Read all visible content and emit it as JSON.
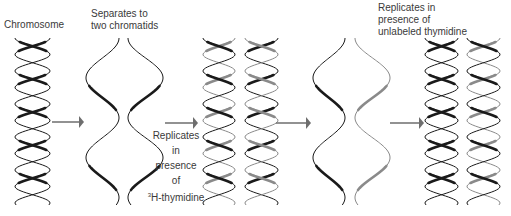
{
  "labels": {
    "chromosome": "Chromosome",
    "separates": [
      "Separates to",
      "two chromatids"
    ],
    "replicates_labeled": [
      "Replicates",
      "in",
      "presence",
      "of"
    ],
    "labeled_sup": "3",
    "labeled_thymidine": "H-thymidine",
    "replicates_unlabeled": [
      "Replicates in",
      "presence of",
      "unlabeled thymidine"
    ]
  },
  "colors": {
    "old_strand": "#1a1a1a",
    "labeled_strand": "#8a8a8a",
    "arrow": "#6e6e6e",
    "text": "#3a3a3a"
  },
  "stages": [
    {
      "name": "chromosome",
      "helices": [
        {
          "type": "double",
          "strands": [
            "old",
            "old"
          ]
        }
      ]
    },
    {
      "name": "separated-chromatids",
      "helices": [
        {
          "type": "single",
          "strands": [
            "old"
          ]
        },
        {
          "type": "single",
          "strands": [
            "old"
          ]
        }
      ]
    },
    {
      "name": "replicated-labeled",
      "helices": [
        {
          "type": "double",
          "strands": [
            "old",
            "labeled"
          ]
        },
        {
          "type": "double",
          "strands": [
            "labeled",
            "old"
          ]
        }
      ]
    },
    {
      "name": "separated-after-label",
      "helices": [
        {
          "type": "single",
          "strands": [
            "old"
          ]
        },
        {
          "type": "single",
          "strands": [
            "labeled"
          ]
        }
      ]
    },
    {
      "name": "replicated-unlabeled",
      "helices": [
        {
          "type": "double",
          "strands": [
            "old",
            "old"
          ]
        },
        {
          "type": "double",
          "strands": [
            "old",
            "labeled"
          ]
        }
      ]
    }
  ],
  "arrows": 4
}
